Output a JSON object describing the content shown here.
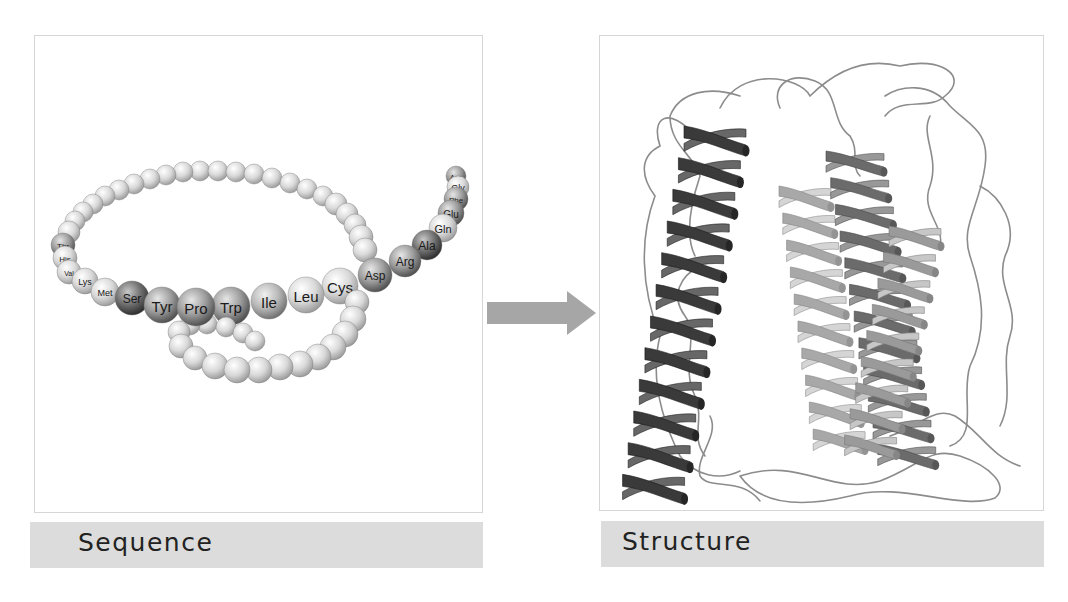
{
  "figure": {
    "left_panel": {
      "caption": "Sequence",
      "description": "Amino acid chain shown as a string of beads",
      "labeled_residues": [
        {
          "label": "Thr",
          "x": 28,
          "y": 209,
          "r": 12,
          "shade": "mid",
          "fs": 8
        },
        {
          "label": "His",
          "x": 30,
          "y": 222,
          "r": 12,
          "shade": "light",
          "fs": 8
        },
        {
          "label": "Val",
          "x": 34,
          "y": 236,
          "r": 12,
          "shade": "light",
          "fs": 7
        },
        {
          "label": "Lys",
          "x": 50,
          "y": 245,
          "r": 13,
          "shade": "light",
          "fs": 9
        },
        {
          "label": "Met",
          "x": 70,
          "y": 256,
          "r": 14,
          "shade": "light",
          "fs": 9
        },
        {
          "label": "Ser",
          "x": 97,
          "y": 262,
          "r": 17,
          "shade": "dark",
          "fs": 12
        },
        {
          "label": "Tyr",
          "x": 127,
          "y": 269,
          "r": 18,
          "shade": "mid",
          "fs": 15
        },
        {
          "label": "Pro",
          "x": 161,
          "y": 271,
          "r": 19,
          "shade": "mid",
          "fs": 15
        },
        {
          "label": "Trp",
          "x": 196,
          "y": 270,
          "r": 19,
          "shade": "mid",
          "fs": 15
        },
        {
          "label": "Ile",
          "x": 234,
          "y": 265,
          "r": 18,
          "shade": "midlight",
          "fs": 15
        },
        {
          "label": "Leu",
          "x": 271,
          "y": 259,
          "r": 18,
          "shade": "light",
          "fs": 15
        },
        {
          "label": "Cys",
          "x": 305,
          "y": 250,
          "r": 18,
          "shade": "light",
          "fs": 15
        },
        {
          "label": "Asp",
          "x": 340,
          "y": 239,
          "r": 17,
          "shade": "mid",
          "fs": 12
        },
        {
          "label": "Arg",
          "x": 370,
          "y": 225,
          "r": 16,
          "shade": "mid",
          "fs": 12
        },
        {
          "label": "Ala",
          "x": 392,
          "y": 209,
          "r": 15,
          "shade": "dark",
          "fs": 12
        },
        {
          "label": "Gln",
          "x": 408,
          "y": 192,
          "r": 14,
          "shade": "light",
          "fs": 11
        },
        {
          "label": "Glu",
          "x": 416,
          "y": 177,
          "r": 13,
          "shade": "mid",
          "fs": 10
        },
        {
          "label": "Phe",
          "x": 421,
          "y": 163,
          "r": 12,
          "shade": "mid",
          "fs": 8
        },
        {
          "label": "Gly",
          "x": 423,
          "y": 151,
          "r": 11,
          "shade": "light",
          "fs": 9
        },
        {
          "label": "Asn",
          "x": 421,
          "y": 140,
          "r": 10,
          "shade": "mid",
          "fs": 7
        }
      ],
      "unlabeled_beads": [
        [
          34,
          196,
          11
        ],
        [
          40,
          185,
          10
        ],
        [
          48,
          176,
          10
        ],
        [
          58,
          168,
          10
        ],
        [
          70,
          160,
          10
        ],
        [
          84,
          154,
          10
        ],
        [
          99,
          148,
          10
        ],
        [
          115,
          143,
          10
        ],
        [
          131,
          139,
          10
        ],
        [
          148,
          136,
          10
        ],
        [
          165,
          135,
          10
        ],
        [
          183,
          135,
          10
        ],
        [
          201,
          136,
          10
        ],
        [
          219,
          138,
          10
        ],
        [
          237,
          142,
          10
        ],
        [
          255,
          147,
          10
        ],
        [
          272,
          153,
          10
        ],
        [
          288,
          160,
          10
        ],
        [
          301,
          168,
          11
        ],
        [
          312,
          178,
          11
        ],
        [
          320,
          189,
          11
        ],
        [
          326,
          201,
          12
        ],
        [
          330,
          214,
          12
        ],
        [
          322,
          266,
          12
        ],
        [
          318,
          283,
          13
        ],
        [
          310,
          298,
          13
        ],
        [
          298,
          311,
          13
        ],
        [
          283,
          321,
          13
        ],
        [
          265,
          328,
          13
        ],
        [
          245,
          331,
          13
        ],
        [
          224,
          334,
          13
        ],
        [
          202,
          334,
          13
        ],
        [
          180,
          330,
          13
        ],
        [
          160,
          322,
          12
        ],
        [
          146,
          310,
          12
        ],
        [
          144,
          296,
          11
        ],
        [
          155,
          289,
          10
        ],
        [
          172,
          288,
          10
        ],
        [
          191,
          291,
          10
        ],
        [
          208,
          297,
          10
        ],
        [
          220,
          305,
          10
        ]
      ]
    },
    "arrow": {
      "direction": "right",
      "color": "#a6a6a6"
    },
    "right_panel": {
      "caption": "Structure",
      "description": "Folded protein 3D structure: bundle of alpha helices (ribbons) connected by loops",
      "helices": [
        {
          "x": 115,
          "top": 90,
          "bottom": 470,
          "width": 62,
          "turns": 12,
          "color": "#3a3a3a",
          "tilt": -10
        },
        {
          "x": 205,
          "top": 150,
          "bottom": 420,
          "width": 52,
          "turns": 10,
          "color": "#a8a8a8",
          "tilt": 8
        },
        {
          "x": 255,
          "top": 115,
          "bottom": 435,
          "width": 58,
          "turns": 12,
          "color": "#6b6b6b",
          "tilt": 10
        },
        {
          "x": 315,
          "top": 190,
          "bottom": 425,
          "width": 52,
          "turns": 9,
          "color": "#9a9a9a",
          "tilt": -12
        }
      ],
      "loop_color": "#8c8c8c"
    }
  },
  "shades": {
    "light": [
      "#ffffff",
      "#d9d9d9",
      "#9a9a9a"
    ],
    "midlight": [
      "#f0f0f0",
      "#b8b8b8",
      "#707070"
    ],
    "mid": [
      "#e6e6e6",
      "#9c9c9c",
      "#4e4e4e"
    ],
    "dark": [
      "#c8c8c8",
      "#6e6e6e",
      "#2c2c2c"
    ]
  }
}
